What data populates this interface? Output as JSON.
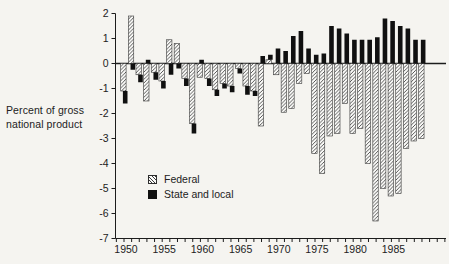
{
  "figure": {
    "ylabel_line1": "Percent of gross",
    "ylabel_line2": "national product",
    "legend_federal": "Federal",
    "legend_state_local": "State and local",
    "colors": {
      "background": "#f5f4f0",
      "ink": "#1c1c1c",
      "bar_fill_hatched": "#fbfbf9",
      "bar_hatch_line": "#3a3a3a",
      "bar_solid": "#101010"
    }
  },
  "chart_data": {
    "type": "bar",
    "title": "",
    "xlabel": "",
    "ylabel": "Percent of gross national product",
    "ylim": [
      -7,
      2
    ],
    "grid": false,
    "legend_position": "inside-lower-left",
    "legend": [
      "Federal",
      "State and local"
    ],
    "ytick_labels": [
      "2",
      "1",
      "0",
      "-1",
      "-2",
      "-3",
      "-4",
      "-5",
      "-6",
      "-7"
    ],
    "ytick_values": [
      2,
      1,
      0,
      -1,
      -2,
      -3,
      -4,
      -5,
      -6,
      -7
    ],
    "xtick_labeled_years": [
      1950,
      1955,
      1960,
      1965,
      1970,
      1975,
      1980,
      1985
    ],
    "xtick_minor_year_start": 1949,
    "xtick_minor_year_end": 1992,
    "bar_style_note": "Federal bars hatched, State and local bars solid black; state-local segment stacks onto the end of the federal bar when both share a sign",
    "categories": [
      1950,
      1951,
      1952,
      1953,
      1954,
      1955,
      1956,
      1957,
      1958,
      1959,
      1960,
      1961,
      1962,
      1963,
      1964,
      1965,
      1966,
      1967,
      1968,
      1969,
      1970,
      1971,
      1972,
      1973,
      1974,
      1975,
      1976,
      1977,
      1978,
      1979,
      1980,
      1981,
      1982,
      1983,
      1984,
      1985,
      1986,
      1987,
      1988,
      1989
    ],
    "series": [
      {
        "name": "Federal",
        "values": [
          -1.1,
          1.9,
          -0.45,
          -1.5,
          -0.35,
          -0.7,
          0.95,
          0.8,
          -0.6,
          -2.4,
          -0.55,
          -0.6,
          -1.05,
          -0.8,
          -0.9,
          -0.2,
          -0.9,
          -1.1,
          -2.5,
          0.15,
          -0.45,
          -1.95,
          -1.8,
          -0.8,
          -0.4,
          -3.6,
          -4.4,
          -2.9,
          -2.8,
          -1.6,
          -2.8,
          -2.6,
          -4.0,
          -6.3,
          -5.0,
          -5.3,
          -5.2,
          -3.4,
          -3.1,
          -3.0
        ]
      },
      {
        "name": "State and local",
        "values": [
          -0.5,
          -0.25,
          -0.3,
          0.15,
          -0.3,
          -0.3,
          -0.45,
          -0.2,
          -0.3,
          -0.4,
          0.15,
          -0.3,
          -0.25,
          -0.2,
          -0.25,
          -0.2,
          -0.35,
          -0.2,
          0.3,
          0.2,
          0.6,
          0.5,
          1.1,
          1.3,
          0.6,
          0.35,
          0.4,
          1.5,
          1.4,
          1.2,
          0.95,
          0.95,
          0.95,
          1.05,
          1.8,
          1.7,
          1.5,
          1.4,
          0.95,
          0.95
        ]
      }
    ]
  }
}
